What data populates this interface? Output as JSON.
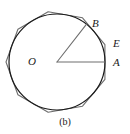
{
  "figure": {
    "caption": "(b)",
    "labels": {
      "center": "O",
      "vertex_b": "B",
      "point_e": "E",
      "point_a": "A"
    },
    "colors": {
      "circle_stroke": "#1a1a1a",
      "polygon_stroke": "#6e6e6e",
      "radius_stroke": "#6e6e6e",
      "background": "#ffffff",
      "text": "#1a1a1a"
    },
    "geometry": {
      "center_x": 57,
      "center_y": 62,
      "circle_radius": 48,
      "polygon_sides": 9,
      "polygon_circumradius": 51,
      "polygon_rotation_deg": -20,
      "radius_oa_angle_deg": 0,
      "radius_ob_angle_deg": 52
    }
  },
  "chart_data": {
    "type": "diagram",
    "title": "(b)",
    "elements": [
      {
        "name": "circle",
        "kind": "circle",
        "cx": 57,
        "cy": 62,
        "r": 48,
        "stroke": "#1a1a1a"
      },
      {
        "name": "circumscribed-nonagon",
        "kind": "regular-polygon",
        "sides": 9,
        "cx": 57,
        "cy": 62,
        "circumradius": 51,
        "rotation_deg": -20,
        "stroke": "#6e6e6e"
      },
      {
        "name": "radius-OB",
        "kind": "segment",
        "from": "O",
        "to": "B",
        "x1": 57,
        "y1": 62,
        "x2": 87,
        "y2": 24
      },
      {
        "name": "radius-OA",
        "kind": "segment",
        "from": "O",
        "to": "A",
        "x1": 57,
        "y1": 62,
        "x2": 105,
        "y2": 62
      }
    ],
    "points": [
      {
        "label": "O",
        "x": 57,
        "y": 62,
        "role": "center"
      },
      {
        "label": "B",
        "x": 87,
        "y": 24,
        "role": "point-on-circle"
      },
      {
        "label": "E",
        "x": 110,
        "y": 43,
        "role": "polygon-vertex"
      },
      {
        "label": "A",
        "x": 105,
        "y": 62,
        "role": "point-on-circle"
      }
    ]
  }
}
